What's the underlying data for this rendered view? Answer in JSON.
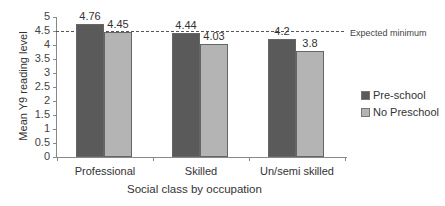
{
  "chart_data": {
    "type": "bar",
    "title": "",
    "xlabel": "Social class by occupation",
    "ylabel": "Mean Y9 reading level",
    "ylim": [
      0,
      5
    ],
    "yticks": [
      "0",
      "0.5",
      "1",
      "1.5",
      "2",
      "2.5",
      "3",
      "3.5",
      "4",
      "4.5",
      "5"
    ],
    "categories": [
      "Professional",
      "Skilled",
      "Un/semi skilled"
    ],
    "series": [
      {
        "name": "Pre-school",
        "color": "#5a5a5a",
        "values": [
          4.76,
          4.44,
          4.2
        ],
        "labels": [
          "4.76",
          "4.44",
          "4.2"
        ]
      },
      {
        "name": "No Preschool",
        "color": "#b4b4b4",
        "values": [
          4.45,
          4.03,
          3.8
        ],
        "labels": [
          "4.45",
          "4.03",
          "3.8"
        ]
      }
    ],
    "reference_line": {
      "value": 4.5,
      "label": "Expected minimum",
      "style": "dashed"
    },
    "grid": false,
    "legend_position": "right"
  }
}
